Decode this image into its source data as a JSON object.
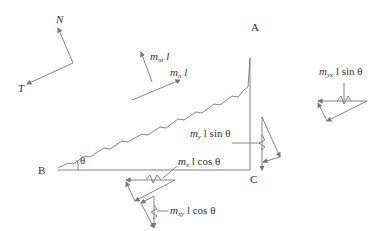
{
  "diagram": {
    "axes": {
      "normal_label": "N",
      "tangent_label": "T"
    },
    "points": {
      "A": "A",
      "B": "B",
      "C": "C"
    },
    "angle_label": "θ",
    "moments": {
      "mnt": {
        "m": "m",
        "sub": "nt",
        "rest": " l"
      },
      "mn": {
        "m": "m",
        "sub": "n",
        "rest": " l"
      },
      "my": {
        "m": "m",
        "sub": "y",
        "rest": " l sin θ"
      },
      "myx": {
        "m": "m",
        "sub": "yx",
        "rest": " l sin θ"
      },
      "mx": {
        "m": "m",
        "sub": "x",
        "rest": " l cos θ"
      },
      "mxy": {
        "m": "m",
        "sub": "xy",
        "rest": " l cos θ"
      }
    },
    "colors": {
      "line": "#777777",
      "text": "#333333"
    }
  }
}
